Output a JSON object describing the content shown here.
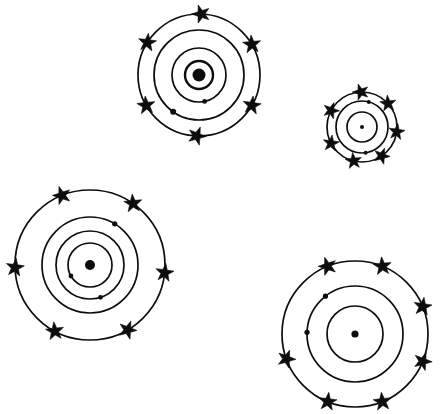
{
  "canvas": {
    "width": 443,
    "height": 414,
    "background_color": "#ffffff",
    "ink_color": "#0d0d0d",
    "title": "Bohr-model atom diagrams",
    "figure_count": 4
  },
  "chart_data": {
    "type": "scatter",
    "subtitle": "",
    "xlabel": "",
    "ylabel": "",
    "grid": false,
    "legend": "none",
    "xlim": [
      0,
      443
    ],
    "ylim": [
      0,
      414
    ],
    "units": "pixels",
    "series": [
      {
        "name": "atom-top-left",
        "center": [
          199,
          75
        ],
        "nucleus_radius": 6.5,
        "ring_radii": [
          14,
          27,
          45,
          61
        ],
        "ring_stroke_widths": [
          2.4,
          1.7,
          1.7,
          1.7
        ],
        "star_ring_index": 3,
        "star_count": 6,
        "star_angles_deg": [
          272,
          330,
          30,
          92,
          150,
          212
        ],
        "star_size": 9.5,
        "electron_count": 2,
        "electrons": [
          {
            "ring_index": 1,
            "angle_deg": 78,
            "radius": 2.4
          },
          {
            "ring_index": 2,
            "angle_deg": 125,
            "radius": 3.0
          }
        ]
      },
      {
        "name": "atom-top-right",
        "center": [
          362,
          127
        ],
        "nucleus_radius": 2.0,
        "ring_radii": [
          15,
          26,
          35
        ],
        "ring_stroke_widths": [
          1.7,
          1.7,
          1.7
        ],
        "star_ring_index": 2,
        "star_count": 7,
        "star_angles_deg": [
          268,
          318,
          8,
          56,
          104,
          152,
          208
        ],
        "star_size": 8.5,
        "electron_count": 2,
        "electrons": [
          {
            "ring_index": 1,
            "angle_deg": 285,
            "radius": 2.0
          },
          {
            "ring_index": 1,
            "angle_deg": 82,
            "radius": 2.0
          }
        ]
      },
      {
        "name": "atom-bottom-left",
        "center": [
          90,
          265
        ],
        "nucleus_radius": 5.0,
        "ring_radii": [
          22,
          34,
          48,
          75
        ],
        "ring_stroke_widths": [
          1.7,
          1.7,
          1.7,
          1.7
        ],
        "star_ring_index": 3,
        "star_count": 6,
        "star_angles_deg": [
          248,
          305,
          6,
          60,
          118,
          178
        ],
        "star_size": 9.5,
        "electron_count": 3,
        "electrons": [
          {
            "ring_index": 0,
            "angle_deg": 150,
            "radius": 2.4
          },
          {
            "ring_index": 1,
            "angle_deg": 72,
            "radius": 2.4
          },
          {
            "ring_index": 2,
            "angle_deg": 301,
            "radius": 2.6
          }
        ]
      },
      {
        "name": "atom-bottom-right",
        "center": [
          355,
          334
        ],
        "nucleus_radius": 3.6,
        "ring_radii": [
          28,
          48,
          73
        ],
        "ring_stroke_widths": [
          1.7,
          1.7,
          1.7
        ],
        "star_ring_index": 2,
        "star_count": 7,
        "star_angles_deg": [
          248,
          292,
          338,
          22,
          68,
          112,
          160
        ],
        "star_size": 9.5,
        "electron_count": 2,
        "electrons": [
          {
            "ring_index": 1,
            "angle_deg": 182,
            "radius": 2.6
          },
          {
            "ring_index": 1,
            "angle_deg": 232,
            "radius": 2.6
          }
        ]
      }
    ]
  }
}
